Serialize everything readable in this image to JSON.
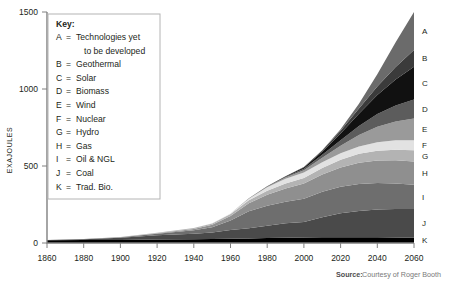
{
  "chart_data": {
    "type": "area",
    "stacked": true,
    "title": "",
    "xlabel": "",
    "ylabel": "EXAJOULES",
    "xlim": [
      1860,
      2060
    ],
    "ylim": [
      0,
      1500
    ],
    "xticks": [
      1860,
      1880,
      1900,
      1920,
      1940,
      1960,
      1980,
      2000,
      2020,
      2040,
      2060
    ],
    "yticks": [
      0,
      500,
      1000,
      1500
    ],
    "grid": false,
    "legend_position": "inside-top-left",
    "x": [
      1860,
      1880,
      1900,
      1920,
      1940,
      1950,
      1960,
      1970,
      1980,
      1990,
      2000,
      2010,
      2020,
      2030,
      2040,
      2050,
      2060
    ],
    "series": [
      {
        "key": "K",
        "name": "Trad. Bio.",
        "color": "#000000",
        "values": [
          18,
          19,
          20,
          22,
          24,
          26,
          28,
          30,
          32,
          34,
          36,
          38,
          38,
          38,
          37,
          36,
          34
        ]
      },
      {
        "key": "J",
        "name": "Coal",
        "color": "#4a4a4a",
        "values": [
          2,
          6,
          14,
          28,
          36,
          42,
          56,
          66,
          80,
          94,
          100,
          130,
          155,
          170,
          180,
          185,
          186
        ]
      },
      {
        "key": "I",
        "name": "Oil & NGL",
        "color": "#6e6e6e",
        "values": [
          0,
          1,
          3,
          10,
          22,
          34,
          62,
          110,
          130,
          140,
          152,
          165,
          172,
          175,
          172,
          166,
          158
        ]
      },
      {
        "key": "H",
        "name": "Gas",
        "color": "#8f8f8f",
        "values": [
          0,
          0,
          1,
          3,
          9,
          16,
          30,
          52,
          72,
          86,
          98,
          112,
          126,
          138,
          146,
          150,
          152
        ]
      },
      {
        "key": "G",
        "name": "Hydro",
        "color": "#b3b3b3",
        "values": [
          0,
          0,
          1,
          3,
          6,
          9,
          13,
          20,
          26,
          32,
          36,
          42,
          50,
          58,
          64,
          68,
          72
        ]
      },
      {
        "key": "F",
        "name": "Nuclear",
        "color": "#e2e2e2",
        "values": [
          0,
          0,
          0,
          0,
          0,
          1,
          3,
          10,
          22,
          32,
          36,
          38,
          42,
          48,
          56,
          62,
          66
        ]
      },
      {
        "key": "E",
        "name": "Wind",
        "color": "#9a9a9a",
        "values": [
          0,
          0,
          0,
          0,
          0,
          0,
          0,
          1,
          3,
          7,
          14,
          28,
          48,
          74,
          100,
          122,
          140
        ]
      },
      {
        "key": "D",
        "name": "Biomass",
        "color": "#5c5c5c",
        "values": [
          0,
          0,
          0,
          0,
          0,
          0,
          0,
          1,
          2,
          5,
          10,
          20,
          36,
          58,
          82,
          104,
          124
        ]
      },
      {
        "key": "C",
        "name": "Solar",
        "color": "#111111",
        "values": [
          0,
          0,
          0,
          0,
          0,
          0,
          0,
          0,
          1,
          3,
          8,
          20,
          44,
          80,
          124,
          168,
          212
        ]
      },
      {
        "key": "B",
        "name": "Geothermal",
        "color": "#3b3b3b",
        "values": [
          0,
          0,
          0,
          0,
          0,
          0,
          0,
          0,
          0,
          1,
          3,
          8,
          18,
          34,
          56,
          82,
          110
        ]
      },
      {
        "key": "A",
        "name": "Technologies yet to be developed",
        "color": "#6b6b6b",
        "values": [
          0,
          0,
          0,
          0,
          0,
          0,
          0,
          0,
          0,
          0,
          0,
          2,
          10,
          32,
          78,
          160,
          246
        ]
      }
    ]
  },
  "legend": {
    "title": "Key:",
    "equals": "=",
    "items": [
      {
        "key": "A",
        "label_line1": "Technologies yet",
        "label_line2": "to be developed"
      },
      {
        "key": "B",
        "label_line1": "Geothermal",
        "label_line2": ""
      },
      {
        "key": "C",
        "label_line1": "Solar",
        "label_line2": ""
      },
      {
        "key": "D",
        "label_line1": "Biomass",
        "label_line2": ""
      },
      {
        "key": "E",
        "label_line1": "Wind",
        "label_line2": ""
      },
      {
        "key": "F",
        "label_line1": "Nuclear",
        "label_line2": ""
      },
      {
        "key": "G",
        "label_line1": "Hydro",
        "label_line2": ""
      },
      {
        "key": "H",
        "label_line1": "Gas",
        "label_line2": ""
      },
      {
        "key": "I",
        "label_line1": "Oil & NGL",
        "label_line2": ""
      },
      {
        "key": "J",
        "label_line1": "Coal",
        "label_line2": ""
      },
      {
        "key": "K",
        "label_line1": "Trad. Bio.",
        "label_line2": ""
      }
    ]
  },
  "band_letters": [
    "A",
    "B",
    "C",
    "D",
    "E",
    "F",
    "G",
    "H",
    "I",
    "J",
    "K"
  ],
  "source": {
    "label": "Source:",
    "text": "Courtesy of Roger Booth"
  }
}
